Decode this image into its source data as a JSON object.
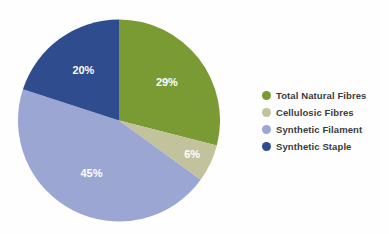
{
  "chart_data": {
    "type": "pie",
    "title": "",
    "subtitle": "",
    "xlabel": "",
    "ylabel": "",
    "grid": false,
    "legend_position": "right",
    "units": "percent",
    "start_angle_deg": 0,
    "direction": "clockwise",
    "categories": [
      "Total Natural Fibres",
      "Cellulosic Fibres",
      "Synthetic Filament",
      "Synthetic Staple"
    ],
    "values": [
      29,
      6,
      45,
      20
    ],
    "data_labels": [
      "29%",
      "6%",
      "45%",
      "20%"
    ],
    "colors": [
      "#7a9a33",
      "#c2c29c",
      "#9ba6d3",
      "#2e4c8e"
    ],
    "slices": [
      {
        "label": "Total Natural Fibres",
        "value": 29,
        "data_label": "29%",
        "color": "#7a9a33"
      },
      {
        "label": "Cellulosic Fibres",
        "value": 6,
        "data_label": "6%",
        "color": "#c2c29c"
      },
      {
        "label": "Synthetic Filament",
        "value": 45,
        "data_label": "45%",
        "color": "#9ba6d3"
      },
      {
        "label": "Synthetic Staple",
        "value": 20,
        "data_label": "20%",
        "color": "#2e4c8e"
      }
    ]
  },
  "legend": {
    "items": [
      {
        "label": "Total Natural Fibres",
        "color": "#7a9a33",
        "swatch_icon": "circle-swatch-icon"
      },
      {
        "label": "Cellulosic Fibres",
        "color": "#c2c29c",
        "swatch_icon": "circle-swatch-icon"
      },
      {
        "label": "Synthetic Filament",
        "color": "#9ba6d3",
        "swatch_icon": "circle-swatch-icon"
      },
      {
        "label": "Synthetic Staple",
        "color": "#2e4c8e",
        "swatch_icon": "circle-swatch-icon"
      }
    ]
  },
  "canvas": {
    "background": "#fefefe",
    "label_text_color": "#ffffff",
    "legend_text_color": "#3b3b3b"
  }
}
